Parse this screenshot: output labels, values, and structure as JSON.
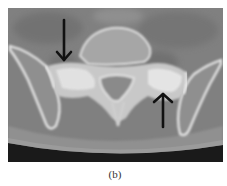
{
  "figure": {
    "panel_label": "(b)",
    "image_description": "Axial CT scan of pelvis showing sacrum and sacroiliac joints",
    "annotations": [
      {
        "type": "arrow",
        "direction": "down",
        "target": "right sacroiliac joint"
      },
      {
        "type": "arrow",
        "direction": "up",
        "target": "left sacroiliac joint"
      }
    ],
    "colors": {
      "background": "#ffffff",
      "scan_soft_tissue": "#7a7a7a",
      "scan_bone": "#e8e8e8",
      "scan_air": "#1a1a1a",
      "arrow": "#111111"
    }
  }
}
